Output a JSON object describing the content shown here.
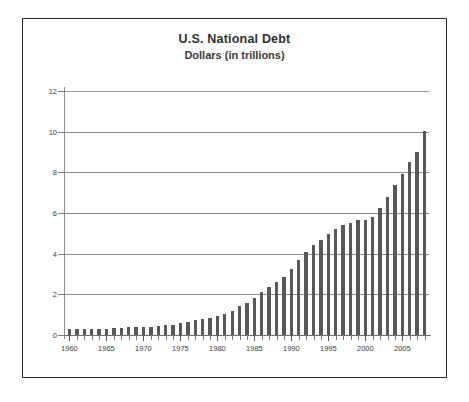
{
  "chart_data": {
    "type": "bar",
    "title": "U.S. National Debt",
    "subtitle": "Dollars (in trillions)",
    "xlabel": "",
    "ylabel": "",
    "ylim": [
      0,
      12
    ],
    "ytick_values": [
      0,
      2,
      4,
      6,
      8,
      10,
      12
    ],
    "ytick_labels": [
      "0",
      "2",
      "4",
      "6",
      "8",
      "10",
      "12"
    ],
    "xtick_labels": [
      "1960",
      "1965",
      "1970",
      "1975",
      "1980",
      "1985",
      "1990",
      "1995",
      "2000",
      "2005"
    ],
    "xtick_values": [
      1960,
      1965,
      1970,
      1975,
      1980,
      1985,
      1990,
      1995,
      2000,
      2005
    ],
    "xlim": [
      1959.4,
      2008.6
    ],
    "grid": "horizontal",
    "legend": "none",
    "bar_color": "#585858",
    "plot_background": "#ffffff",
    "gridline_color": "#8a8a8a",
    "categories": [
      "1960",
      "1961",
      "1962",
      "1963",
      "1964",
      "1965",
      "1966",
      "1967",
      "1968",
      "1969",
      "1970",
      "1971",
      "1972",
      "1973",
      "1974",
      "1975",
      "1976",
      "1977",
      "1978",
      "1979",
      "1980",
      "1981",
      "1982",
      "1983",
      "1984",
      "1985",
      "1986",
      "1987",
      "1988",
      "1989",
      "1990",
      "1991",
      "1992",
      "1993",
      "1994",
      "1995",
      "1996",
      "1997",
      "1998",
      "1999",
      "2000",
      "2001",
      "2002",
      "2003",
      "2004",
      "2005",
      "2006",
      "2007",
      "2008"
    ],
    "values": [
      0.29,
      0.29,
      0.3,
      0.31,
      0.32,
      0.32,
      0.33,
      0.34,
      0.37,
      0.37,
      0.38,
      0.41,
      0.44,
      0.47,
      0.49,
      0.58,
      0.65,
      0.72,
      0.79,
      0.85,
      0.93,
      1.03,
      1.2,
      1.41,
      1.58,
      1.83,
      2.13,
      2.35,
      2.6,
      2.87,
      3.23,
      3.67,
      4.07,
      4.41,
      4.69,
      4.97,
      5.22,
      5.41,
      5.53,
      5.66,
      5.67,
      5.81,
      6.23,
      6.78,
      7.38,
      7.93,
      8.51,
      9.01,
      10.02
    ]
  }
}
